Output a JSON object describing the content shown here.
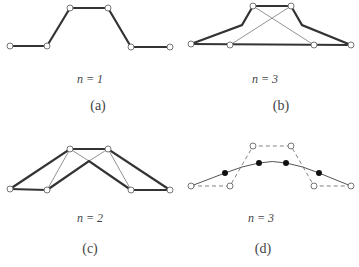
{
  "panels": [
    {
      "id": "a",
      "label": "n = 1",
      "caption": "(a)"
    },
    {
      "id": "b",
      "label": "n = 3",
      "caption": "(b)"
    },
    {
      "id": "c",
      "label": "n = 2",
      "caption": "(c)"
    },
    {
      "id": "d",
      "label": "n = 3",
      "caption": "(d)"
    }
  ],
  "colors": {
    "thick_line": "#333333",
    "thin_line": "#777777",
    "point_fill": "#ffffff",
    "curve_point": "#111111"
  }
}
